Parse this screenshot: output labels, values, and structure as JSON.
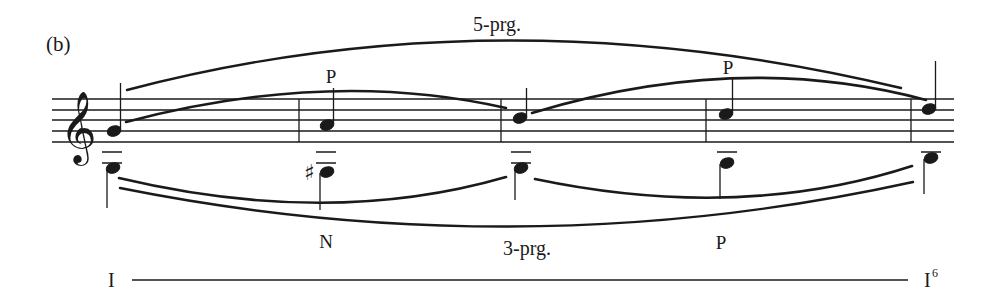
{
  "figure": {
    "label": "(b)",
    "clef": "treble",
    "upper_span_label": "5-prg.",
    "lower_span_label": "3-prg.",
    "harmony": {
      "start": "I",
      "end": "I",
      "end_superscript": "6"
    },
    "upper_voice": [
      {
        "pitch": "G4",
        "annotation": ""
      },
      {
        "pitch": "A4",
        "annotation": "P"
      },
      {
        "pitch": "B4",
        "annotation": ""
      },
      {
        "pitch": "C5",
        "annotation": "P"
      },
      {
        "pitch": "D5",
        "annotation": ""
      }
    ],
    "lower_voice": [
      {
        "pitch": "G3",
        "accidental": "",
        "annotation": ""
      },
      {
        "pitch": "F#3",
        "accidental": "♯",
        "annotation": "N"
      },
      {
        "pitch": "G3",
        "accidental": "",
        "annotation": ""
      },
      {
        "pitch": "A3",
        "accidental": "",
        "annotation": "P"
      },
      {
        "pitch": "B3",
        "accidental": "",
        "annotation": ""
      }
    ],
    "annotations": {
      "upper_p1": "P",
      "upper_p2": "P",
      "lower_n": "N",
      "lower_p": "P"
    },
    "colors": {
      "ink": "#1a1a1a",
      "background": "#ffffff"
    }
  }
}
